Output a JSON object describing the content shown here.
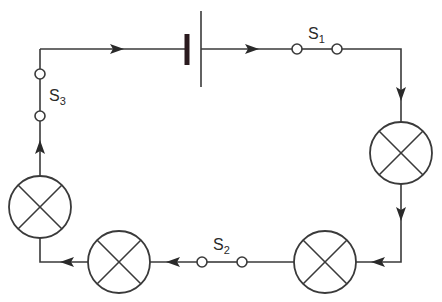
{
  "diagram": {
    "type": "series circuit",
    "components": {
      "battery": {
        "label": ""
      },
      "switches": [
        {
          "id": "s1",
          "label": "S",
          "subscript": "1"
        },
        {
          "id": "s2",
          "label": "S",
          "subscript": "2"
        },
        {
          "id": "s3",
          "label": "S",
          "subscript": "3"
        }
      ],
      "lamps": [
        {
          "id": "lamp-right"
        },
        {
          "id": "lamp-bottom-right"
        },
        {
          "id": "lamp-bottom-left"
        },
        {
          "id": "lamp-left"
        }
      ]
    },
    "current_direction": "clockwise",
    "colors": {
      "line": "#3a3a3a",
      "battery_plate": "#2a1a1e",
      "background": "#ffffff"
    }
  }
}
